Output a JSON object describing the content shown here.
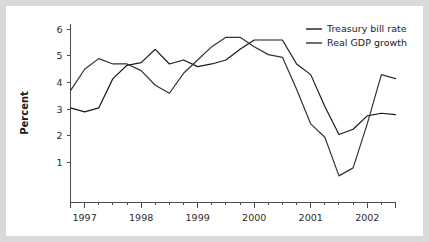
{
  "chart_data": {
    "type": "line",
    "title": "",
    "xlabel": "",
    "ylabel": "Percent",
    "xlim": [
      1996.75,
      2002.5
    ],
    "ylim": [
      -0.5,
      6.2
    ],
    "yticks": [
      1,
      2,
      3,
      4,
      5,
      6
    ],
    "ytick_labels": [
      "1",
      "2",
      "3",
      "4",
      "5",
      "6"
    ],
    "xticks": [
      1997,
      1998,
      1999,
      2000,
      2001,
      2002
    ],
    "xtick_labels": [
      "1997",
      "1998",
      "1999",
      "2000",
      "2001",
      "2002"
    ],
    "minor_xticks_per_interval": 3,
    "grid": false,
    "legend_position": "top-right",
    "x": [
      1996.75,
      1997.0,
      1997.25,
      1997.5,
      1997.75,
      1998.0,
      1998.25,
      1998.5,
      1998.75,
      1999.0,
      1999.25,
      1999.5,
      1999.75,
      2000.0,
      2000.25,
      2000.5,
      2000.75,
      2001.0,
      2001.25,
      2001.5,
      2001.75,
      2002.0,
      2002.25,
      2002.5
    ],
    "x_labels": [
      "1996Q4",
      "1997Q1",
      "1997Q2",
      "1997Q3",
      "1997Q4",
      "1998Q1",
      "1998Q2",
      "1998Q3",
      "1998Q4",
      "1999Q1",
      "1999Q2",
      "1999Q3",
      "1999Q4",
      "2000Q1",
      "2000Q2",
      "2000Q3",
      "2000Q4",
      "2001Q1",
      "2001Q2",
      "2001Q3",
      "2001Q4",
      "2002Q1",
      "2002Q2",
      "2002Q3"
    ],
    "series": [
      {
        "name": "Treasury bill rate",
        "color": "#1a1a1a",
        "values": [
          3.05,
          2.9,
          3.05,
          4.15,
          4.65,
          4.75,
          5.25,
          4.7,
          4.85,
          4.6,
          4.7,
          4.85,
          5.25,
          5.6,
          5.6,
          5.6,
          4.7,
          4.3,
          3.1,
          2.05,
          2.25,
          2.75,
          2.85,
          2.8
        ]
      },
      {
        "name": "Real GDP growth",
        "color": "#333333",
        "values": [
          3.7,
          4.5,
          4.9,
          4.7,
          4.7,
          4.45,
          3.9,
          3.6,
          4.35,
          4.85,
          5.35,
          5.7,
          5.7,
          5.35,
          5.05,
          4.95,
          3.75,
          2.45,
          1.95,
          0.5,
          0.8,
          2.45,
          4.3,
          4.15
        ]
      }
    ]
  },
  "legend": {
    "items": [
      {
        "label": "Treasury bill rate"
      },
      {
        "label": "Real GDP growth"
      }
    ]
  }
}
